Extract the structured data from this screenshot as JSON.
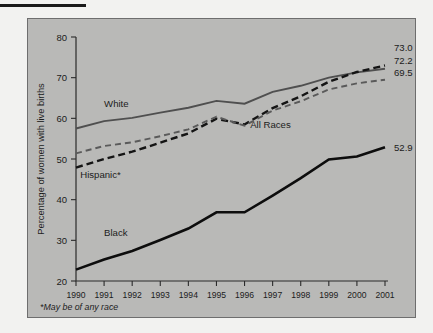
{
  "page": {
    "background_color": "#f2f2f0",
    "plot_background_color": "#b9b9b7",
    "frame_border_color": "#6e6e6e",
    "top_rule_color": "#1a1a1a"
  },
  "footnote": "*May be of any race",
  "chart_data": {
    "type": "line",
    "title": "",
    "subtitle": "",
    "xlabel": "",
    "ylabel": "Percentage of women with live births",
    "xlim": [
      1990,
      2001
    ],
    "ylim": [
      20,
      80
    ],
    "yticks": [
      20,
      30,
      40,
      50,
      60,
      70,
      80
    ],
    "grid": false,
    "legend_position": "inline-annotations",
    "categories": [
      1990,
      1991,
      1992,
      1993,
      1994,
      1995,
      1996,
      1997,
      1998,
      1999,
      2000,
      2001
    ],
    "x": [
      "1990",
      "1991",
      "1992",
      "1993",
      "1994",
      "1995",
      "1996",
      "1997",
      "1998",
      "1999",
      "2000",
      "2001"
    ],
    "series": [
      {
        "name": "White",
        "label": "White",
        "color": "#4f4f4f",
        "style": "solid",
        "width": 1.9,
        "end_value_label": "72.2",
        "label_x": 1991.0,
        "label_y": 62.8,
        "values": [
          57.5,
          59.3,
          60.1,
          61.4,
          62.6,
          64.3,
          63.6,
          66.5,
          68.0,
          70.0,
          71.3,
          72.2
        ]
      },
      {
        "name": "All Races",
        "label": "All Races",
        "color": "#141414",
        "style": "dashed-thick",
        "width": 2.4,
        "end_value_label": "73.0",
        "label_x": 1996.2,
        "label_y": 57.6,
        "values": [
          47.9,
          50.0,
          51.8,
          54.0,
          56.3,
          59.9,
          58.5,
          62.5,
          65.4,
          69.0,
          71.4,
          73.0
        ]
      },
      {
        "name": "Hispanic*",
        "label": "Hispanic*",
        "color": "#5a5a5a",
        "style": "dashed-thin",
        "width": 1.9,
        "end_value_label": "69.5",
        "label_x": 1990.15,
        "label_y": 45.4,
        "values": [
          51.4,
          53.2,
          54.1,
          55.6,
          57.3,
          60.4,
          58.2,
          61.9,
          64.2,
          67.1,
          68.6,
          69.5
        ]
      },
      {
        "name": "Black",
        "label": "Black",
        "color": "#0d0d0d",
        "style": "solid",
        "width": 2.6,
        "end_value_label": "52.9",
        "label_x": 1991.0,
        "label_y": 31.0,
        "values": [
          22.8,
          25.3,
          27.4,
          30.1,
          32.9,
          36.9,
          36.9,
          41.0,
          45.3,
          49.9,
          50.6,
          52.9
        ]
      }
    ]
  }
}
